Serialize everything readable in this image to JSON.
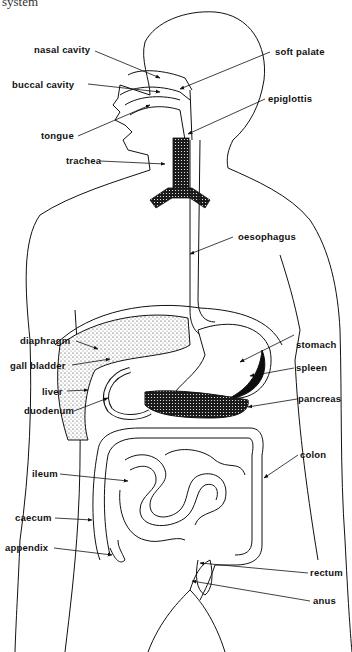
{
  "caption": "system",
  "diagram": {
    "colors": {
      "line": "#111111",
      "background": "#ffffff",
      "spleen": "#0d0d0d",
      "stipple": "#222222"
    },
    "labels_left": [
      {
        "id": "nasal-cavity",
        "text": "nasal cavity"
      },
      {
        "id": "buccal-cavity",
        "text": "buccal cavity"
      },
      {
        "id": "tongue",
        "text": "tongue"
      },
      {
        "id": "trachea",
        "text": "trachea"
      },
      {
        "id": "diaphragm",
        "text": "diaphragm"
      },
      {
        "id": "gall-bladder",
        "text": "gall bladder"
      },
      {
        "id": "liver",
        "text": "liver"
      },
      {
        "id": "duodenum",
        "text": "duodenum"
      },
      {
        "id": "ileum",
        "text": "ileum"
      },
      {
        "id": "caecum",
        "text": "caecum"
      },
      {
        "id": "appendix",
        "text": "appendix"
      }
    ],
    "labels_right": [
      {
        "id": "soft-palate",
        "text": "soft palate"
      },
      {
        "id": "epiglottis",
        "text": "epiglottis"
      },
      {
        "id": "oesophagus",
        "text": "oesophagus"
      },
      {
        "id": "stomach",
        "text": "stomach"
      },
      {
        "id": "spleen",
        "text": "spleen"
      },
      {
        "id": "pancreas",
        "text": "pancreas"
      },
      {
        "id": "colon",
        "text": "colon"
      },
      {
        "id": "rectum",
        "text": "rectum"
      },
      {
        "id": "anus",
        "text": "anus"
      }
    ]
  }
}
